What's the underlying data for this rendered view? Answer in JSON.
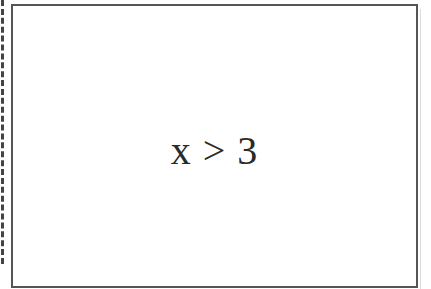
{
  "diagram": {
    "type": "flowchart-node",
    "node": {
      "shape": "rectangle",
      "label": "x > 3",
      "border_color": "#555555",
      "text_color": "#2a2a2a"
    },
    "left_edge": {
      "style": "dashed",
      "color": "#444444"
    }
  }
}
